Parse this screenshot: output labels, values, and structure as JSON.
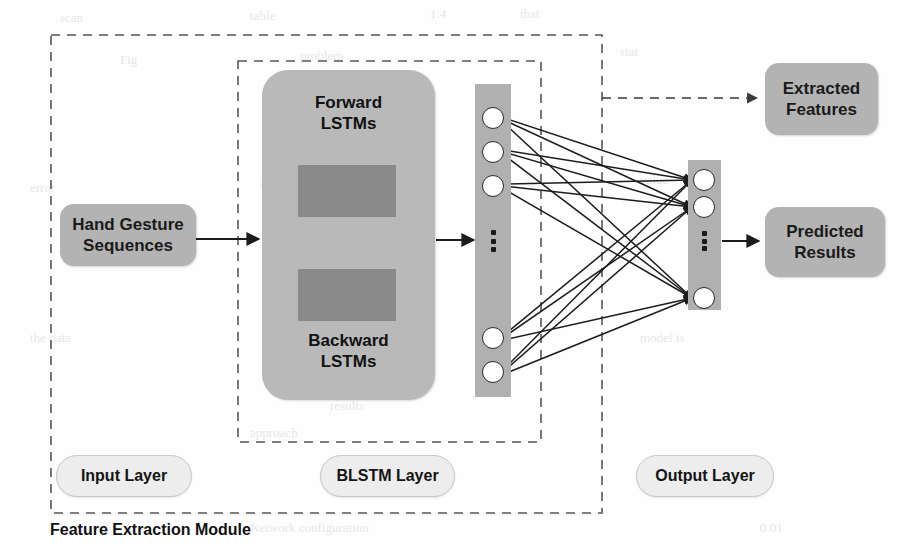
{
  "diagram": {
    "title": "Feature Extraction Module",
    "colors": {
      "box_fill": "#b3b3b3",
      "blstm_fill": "#b9b9b9",
      "inner_bar_fill": "#8a8a8a",
      "node_column_fill": "#b0b0b0",
      "node_fill": "#ffffff",
      "stroke": "#2b2b2b",
      "pill_fill": "#ededed",
      "dashed_stroke": "#555555",
      "background": "#fefefe"
    },
    "boxes": {
      "input": {
        "line1": "Hand Gesture",
        "line2": "Sequences"
      },
      "blstm_forward": {
        "line1": "Forward",
        "line2": "LSTMs"
      },
      "blstm_backward": {
        "line1": "Backward",
        "line2": "LSTMs"
      },
      "extracted": {
        "line1": "Extracted",
        "line2": "Features"
      },
      "predicted": {
        "line1": "Predicted",
        "line2": "Results"
      }
    },
    "layer_labels": {
      "input": "Input Layer",
      "blstm": "BLSTM Layer",
      "output": "Output Layer"
    },
    "groups": {
      "feature_extraction_module": "Feature Extraction Module",
      "blstm_group": "BLSTM Layer"
    },
    "network": {
      "hidden_layer": {
        "name": "hidden-node-column",
        "visible_nodes": 5,
        "top_nodes_y": [
          118,
          152,
          186
        ],
        "bottom_nodes_y": [
          338,
          372
        ],
        "center_x": 493,
        "radius": 11,
        "ellipsis": "vertical-dots"
      },
      "output_layer": {
        "name": "output-node-column",
        "visible_nodes": 3,
        "top_nodes_y": [
          180,
          207
        ],
        "bottom_nodes_y": [
          298
        ],
        "center_x": 704,
        "radius": 11,
        "ellipsis": "vertical-dots"
      },
      "connections": "fully-connected"
    },
    "arrows": {
      "input_to_blstm": "solid-arrow",
      "blstm_to_hidden": "solid-arrow",
      "hidden_to_output": "solid-arrow-bundle",
      "output_to_predicted": "solid-arrow",
      "blstm_to_extracted": "dashed-arrow",
      "forward_lstm_direction": "right-arrow",
      "backward_lstm_direction": "left-arrow"
    },
    "ghost_text": [
      {
        "t": "scan",
        "x": 60,
        "y": 10
      },
      {
        "t": "table",
        "x": 250,
        "y": 8
      },
      {
        "t": "1.4",
        "x": 430,
        "y": 6
      },
      {
        "t": "that",
        "x": 520,
        "y": 6
      },
      {
        "t": "Fig",
        "x": 120,
        "y": 52
      },
      {
        "t": "problem",
        "x": 300,
        "y": 48
      },
      {
        "t": "stat",
        "x": 620,
        "y": 44
      },
      {
        "t": "error",
        "x": 30,
        "y": 180
      },
      {
        "t": "and the",
        "x": 260,
        "y": 175
      },
      {
        "t": "value",
        "x": 640,
        "y": 172
      },
      {
        "t": "the data",
        "x": 30,
        "y": 330
      },
      {
        "t": "results",
        "x": 330,
        "y": 398
      },
      {
        "t": "approach",
        "x": 250,
        "y": 425
      },
      {
        "t": "model is",
        "x": 640,
        "y": 330
      },
      {
        "t": "Network configuration",
        "x": 250,
        "y": 520
      },
      {
        "t": "rate",
        "x": 700,
        "y": 470
      },
      {
        "t": "0.01",
        "x": 760,
        "y": 520
      }
    ]
  }
}
